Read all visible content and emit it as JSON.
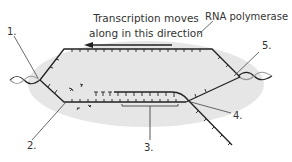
{
  "figure": {
    "panel_letter": "a",
    "caption_line1": "Transcription moves",
    "caption_line2": "along in this direction",
    "direction_arrow": "left",
    "enzyme_label": "RNA polymerase",
    "callouts": [
      {
        "number": "1.",
        "target": "DNA strands separating (left end)"
      },
      {
        "number": "2.",
        "target": "template DNA strand"
      },
      {
        "number": "3.",
        "target": "RNA-DNA hybrid region"
      },
      {
        "number": "4.",
        "target": "RNA transcript exiting"
      },
      {
        "number": "5.",
        "target": "DNA rewinding (right end)"
      }
    ]
  },
  "colors": {
    "polymerase_fill": "#e6e6e6",
    "strand": "#222222",
    "text": "#333333",
    "leader_line": "#444444"
  }
}
